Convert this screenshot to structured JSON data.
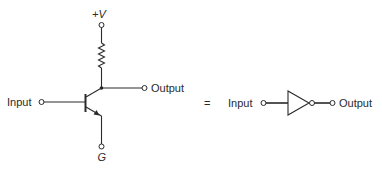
{
  "transistor_circuit": {
    "supply_label": "+V",
    "ground_label": "G",
    "input_label": "Input",
    "output_label": "Output",
    "components": [
      "npn-transistor",
      "collector-resistor"
    ]
  },
  "equals_sign": "=",
  "inverter_symbol": {
    "input_label": "Input",
    "output_label": "Output",
    "components": [
      "buffer-triangle",
      "inversion-bubble"
    ]
  },
  "colors": {
    "ink": "#2a2a2a",
    "background": "#ffffff"
  }
}
